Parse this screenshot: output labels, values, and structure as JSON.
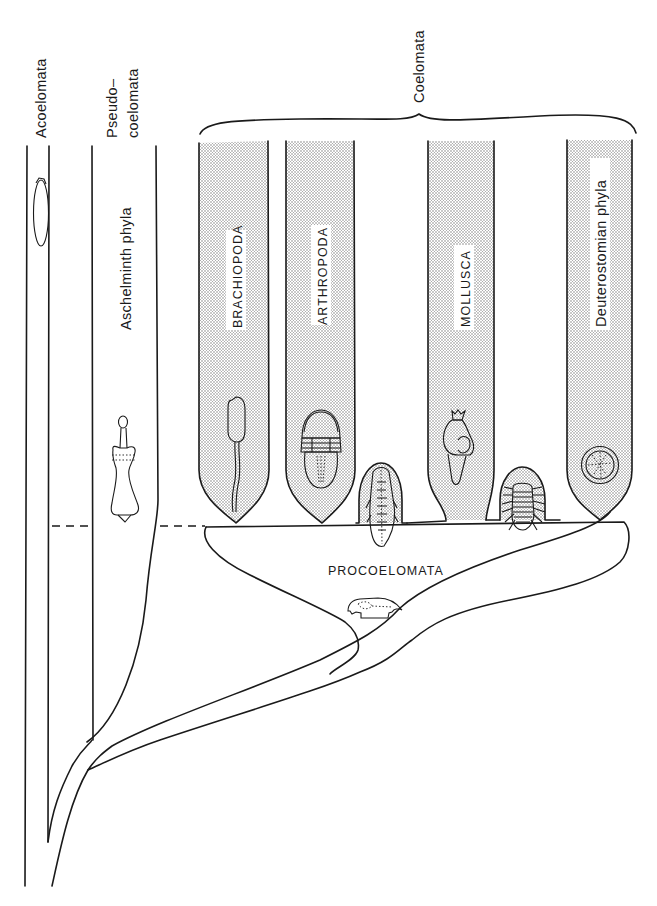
{
  "figure": {
    "type": "phylogenetic-diagram",
    "groups": {
      "acoelomata": "Acoelomata",
      "pseudocoelomata_line1": "Pseudo–",
      "pseudocoelomata_line2": "coelomata",
      "coelomata": "Coelomata",
      "procoelomata": "PROCOELOMATA"
    },
    "lineages": {
      "aschelminth": "Aschelminth phyla",
      "brachiopoda": "BRACHIOPODA",
      "arthropoda": "ARTHROPODA",
      "mollusca": "MOLLUSCA",
      "deuterostomian": "Deuterostomian phyla"
    },
    "colors": {
      "line": "#1a1a1a",
      "stipple": "#c9c9c9",
      "background": "#ffffff"
    }
  }
}
